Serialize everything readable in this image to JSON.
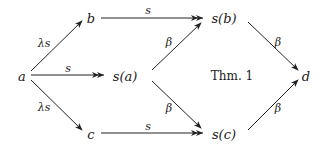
{
  "diagram": {
    "nodes": {
      "a": "a",
      "b": "b",
      "c": "c",
      "sa": "s(a)",
      "sb": "s(b)",
      "sc": "s(c)",
      "d": "d"
    },
    "annotation": "Thm. 1",
    "edges": [
      {
        "from": "a",
        "to": "b",
        "label": "λs",
        "head": "single"
      },
      {
        "from": "a",
        "to": "s(a)",
        "label": "s",
        "head": "double"
      },
      {
        "from": "a",
        "to": "c",
        "label": "λs",
        "head": "single"
      },
      {
        "from": "b",
        "to": "s(b)",
        "label": "s",
        "head": "double"
      },
      {
        "from": "c",
        "to": "s(c)",
        "label": "s",
        "head": "double"
      },
      {
        "from": "s(a)",
        "to": "s(b)",
        "label": "β",
        "head": "single"
      },
      {
        "from": "s(a)",
        "to": "s(c)",
        "label": "β",
        "head": "single"
      },
      {
        "from": "s(b)",
        "to": "d",
        "label": "β",
        "head": "single"
      },
      {
        "from": "s(c)",
        "to": "d",
        "label": "β",
        "head": "single"
      }
    ],
    "labels": {
      "a_b": "λs",
      "a_sa": "s",
      "a_c": "λs",
      "b_sb": "s",
      "c_sc": "s",
      "sa_sb": "β",
      "sa_sc": "β",
      "sb_d": "β",
      "sc_d": "β"
    }
  }
}
